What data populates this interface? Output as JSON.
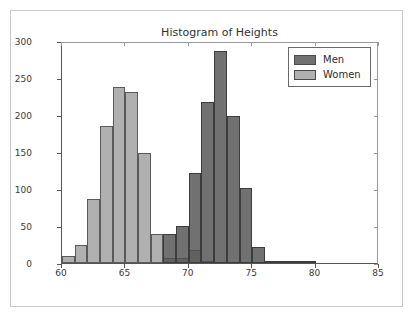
{
  "chart_data": {
    "type": "bar",
    "subtype": "histogram",
    "title": "Histogram of Heights",
    "xlabel": "",
    "ylabel": "",
    "xlim": [
      60,
      85
    ],
    "ylim": [
      0,
      300
    ],
    "xticks": [
      60,
      65,
      70,
      75,
      80,
      85
    ],
    "yticks": [
      0,
      50,
      100,
      150,
      200,
      250,
      300
    ],
    "grid": false,
    "bin_width": 1,
    "legend_position": "upper right",
    "series": [
      {
        "name": "Women",
        "color": "#969696",
        "alpha": 0.75,
        "bin_starts": [
          60,
          61,
          62,
          63,
          64,
          65,
          66,
          67,
          68,
          69,
          70,
          71,
          72
        ],
        "values": [
          10,
          25,
          87,
          185,
          238,
          231,
          149,
          39,
          7,
          7,
          18,
          2,
          0
        ]
      },
      {
        "name": "Men",
        "color": "#4e4e4e",
        "alpha": 0.8,
        "bin_starts": [
          68,
          69,
          70,
          71,
          72,
          73,
          74,
          75,
          76,
          77,
          78,
          79
        ],
        "values": [
          39,
          50,
          121,
          217,
          286,
          198,
          102,
          22,
          2,
          2,
          1,
          1
        ]
      }
    ]
  },
  "legend": {
    "entries": [
      {
        "label": "Men"
      },
      {
        "label": "Women"
      }
    ]
  },
  "axis": {
    "x_tick_labels": [
      "60",
      "65",
      "70",
      "75",
      "80",
      "85"
    ],
    "y_tick_labels": [
      "0",
      "50",
      "100",
      "150",
      "200",
      "250",
      "300"
    ]
  },
  "colors": {
    "men": "#4e4e4e",
    "women": "#969696",
    "axis": "#555555",
    "frame": "#c9c9c9",
    "background": "#ffffff"
  }
}
